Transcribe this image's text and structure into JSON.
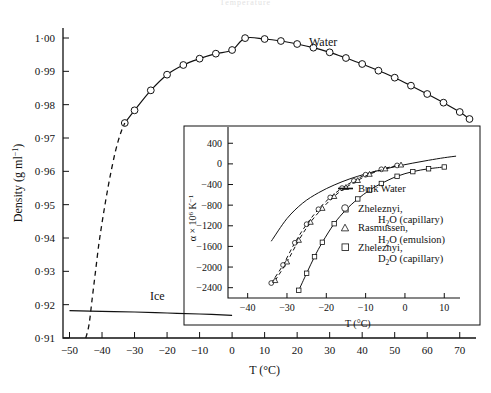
{
  "figure": {
    "top_partial_text": "Temperature",
    "main_curve_label": "Water",
    "ice_curve_label": "Ice"
  },
  "main_axes": {
    "xlabel": "T (°C)",
    "ylabel": "Density (g ml−1)",
    "ylabel_parts": {
      "base": "Density (g ml",
      "sup": "−1",
      "tail": ")"
    },
    "xticks": [
      -50,
      -40,
      -30,
      -20,
      -10,
      0,
      10,
      20,
      30,
      40,
      50,
      60,
      70
    ],
    "xticklabels": [
      "−50",
      "−40",
      "−30",
      "−20",
      "−10",
      "0",
      "10",
      "20",
      "30",
      "40",
      "50",
      "60",
      "70"
    ],
    "yticks": [
      0.91,
      0.92,
      0.93,
      0.94,
      0.95,
      0.96,
      0.97,
      0.98,
      0.99,
      1.0
    ],
    "yticklabels": [
      "0·91",
      "0·92",
      "0·93",
      "0·94",
      "0·95",
      "0·96",
      "0·97",
      "0·98",
      "0·99",
      "1·00"
    ],
    "xlim": [
      -52,
      75
    ],
    "ylim": [
      0.91,
      1.003
    ]
  },
  "inset_axes": {
    "xlabel": "T (°C)",
    "ylabel": "α × 106 K−1",
    "ylabel_parts": {
      "base": "α × 10",
      "sup": "6",
      "tail": " K",
      "sup2": "−1"
    },
    "xticks": [
      -40,
      -30,
      -20,
      -10,
      0,
      10
    ],
    "xticklabels": [
      "−40",
      "−30",
      "−20",
      "−10",
      "0",
      "10"
    ],
    "yticks": [
      -2400,
      -2000,
      -1600,
      -1200,
      -800,
      -400,
      0,
      400
    ],
    "yticklabels": [
      "−2400",
      "−2000",
      "−1600",
      "−1200",
      "−800",
      "−400",
      "0",
      "400"
    ],
    "xlim": [
      -45,
      14
    ],
    "ylim": [
      -2600,
      560
    ]
  },
  "legend": {
    "items": [
      {
        "marker": "line",
        "line1": "Bulk Water",
        "line2": ""
      },
      {
        "marker": "circle",
        "line1": "Zheleznyi,",
        "line2": "H2O (capillary)",
        "l2a": "H",
        "l2sub": "2",
        "l2b": "O (capillary)"
      },
      {
        "marker": "triangle",
        "line1": "Rasmussen,",
        "line2": "H2O (emulsion)",
        "l2a": "H",
        "l2sub": "2",
        "l2b": "O (emulsion)"
      },
      {
        "marker": "square",
        "line1": "Zheleznyi,",
        "line2": "D2O (capillary)",
        "l2a": "D",
        "l2sub": "2",
        "l2b": "O (capillary)"
      }
    ]
  },
  "chart_data": {
    "type": "line",
    "title": "",
    "xlabel": "T (°C)",
    "ylabel": "Density (g ml^-1)",
    "xlim": [
      -52,
      75
    ],
    "ylim": [
      0.91,
      1.003
    ],
    "grid": false,
    "legend_position": "inset-right",
    "series": [
      {
        "name": "Water",
        "marker": "circle",
        "linestyle": "solid",
        "x": [
          -33,
          -30,
          -25,
          -20,
          -15,
          -10,
          -5,
          0,
          4,
          10,
          15,
          20,
          25,
          30,
          35,
          40,
          45,
          50,
          55,
          60,
          65,
          70,
          73
        ],
        "y": [
          0.9745,
          0.9783,
          0.9843,
          0.989,
          0.9919,
          0.9938,
          0.9953,
          0.9964,
          0.99997,
          0.9997,
          0.9991,
          0.9982,
          0.9971,
          0.9957,
          0.994,
          0.9922,
          0.9902,
          0.9881,
          0.9857,
          0.9832,
          0.9806,
          0.9778,
          0.9757
        ]
      },
      {
        "name": "Water (extrapolated)",
        "marker": "none",
        "linestyle": "dashed",
        "x": [
          -45,
          -44,
          -43,
          -42,
          -41,
          -40,
          -39,
          -38,
          -37,
          -36,
          -35,
          -34,
          -33
        ],
        "y": [
          0.91,
          0.914,
          0.922,
          0.93,
          0.938,
          0.9445,
          0.9505,
          0.956,
          0.961,
          0.9655,
          0.9692,
          0.9722,
          0.9745
        ]
      },
      {
        "name": "Ice",
        "marker": "none",
        "linestyle": "solid",
        "x": [
          -50,
          -40,
          -30,
          -20,
          -10,
          0
        ],
        "y": [
          0.9182,
          0.918,
          0.9178,
          0.9175,
          0.9172,
          0.9168
        ]
      }
    ],
    "inset": {
      "type": "line",
      "xlabel": "T (°C)",
      "ylabel": "alpha x 10^6 K^-1",
      "xlim": [
        -45,
        14
      ],
      "ylim": [
        -2600,
        560
      ],
      "series": [
        {
          "name": "Bulk Water",
          "marker": "none",
          "linestyle": "solid",
          "x": [
            -34,
            -30,
            -26,
            -22,
            -18,
            -14,
            -10,
            -6,
            -2,
            2,
            6,
            10,
            13
          ],
          "y": [
            -1500,
            -1060,
            -760,
            -560,
            -410,
            -290,
            -195,
            -115,
            -45,
            15,
            70,
            120,
            150
          ]
        },
        {
          "name": "Zheleznyi, H2O (capillary)",
          "marker": "circle",
          "linestyle": "dashed",
          "x": [
            -34,
            -31,
            -28,
            -25,
            -22,
            -19,
            -16,
            -13,
            -10,
            -6,
            -2
          ],
          "y": [
            -2310,
            -1960,
            -1530,
            -1170,
            -880,
            -650,
            -470,
            -330,
            -210,
            -105,
            -30
          ]
        },
        {
          "name": "Rasmussen, H2O (emulsion)",
          "marker": "triangle",
          "linestyle": "dashed",
          "x": [
            -33,
            -30,
            -27,
            -24,
            -21,
            -18,
            -15,
            -12,
            -9,
            -5,
            -1
          ],
          "y": [
            -2260,
            -1900,
            -1480,
            -1130,
            -860,
            -630,
            -455,
            -320,
            -200,
            -95,
            -20
          ]
        },
        {
          "name": "Zheleznyi, D2O (capillary)",
          "marker": "square",
          "linestyle": "solid",
          "x": [
            -27,
            -25,
            -23,
            -21,
            -18,
            -15,
            -12,
            -9,
            -6,
            -2,
            2,
            6,
            10
          ],
          "y": [
            -2450,
            -2120,
            -1800,
            -1520,
            -1160,
            -890,
            -680,
            -510,
            -380,
            -240,
            -150,
            -95,
            -60
          ]
        }
      ]
    }
  }
}
